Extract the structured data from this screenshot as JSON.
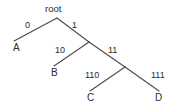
{
  "figure": {
    "type": "binary-tree-diagram",
    "background_color": "#ffffff",
    "line_color": "#4a4a4a",
    "text_color": "#2b2b2b",
    "width": 180,
    "height": 109
  },
  "root": {
    "label": "root",
    "x": 57,
    "y": 18
  },
  "edges": [
    {
      "id": "e-root-A",
      "label": "0",
      "from": [
        57,
        18
      ],
      "to": [
        14,
        41
      ],
      "label_x": 25,
      "label_y": 21
    },
    {
      "id": "e-root-n1",
      "label": "1",
      "from": [
        57,
        18
      ],
      "to": [
        89,
        42
      ],
      "label_x": 72,
      "label_y": 21
    },
    {
      "id": "e-n1-B",
      "label": "10",
      "from": [
        89,
        42
      ],
      "to": [
        54,
        66
      ],
      "label_x": 55,
      "label_y": 46
    },
    {
      "id": "e-n1-n2",
      "label": "11",
      "from": [
        89,
        42
      ],
      "to": [
        125,
        67
      ],
      "label_x": 108,
      "label_y": 46
    },
    {
      "id": "e-n2-C",
      "label": "110",
      "from": [
        125,
        67
      ],
      "to": [
        90,
        91
      ],
      "label_x": 85,
      "label_y": 71
    },
    {
      "id": "e-n2-D",
      "label": "111",
      "from": [
        125,
        67
      ],
      "to": [
        159,
        91
      ],
      "label_x": 151,
      "label_y": 71
    }
  ],
  "leaves": [
    {
      "id": "leaf-A",
      "label": "A",
      "code": "0",
      "x": 13,
      "y": 43
    },
    {
      "id": "leaf-B",
      "label": "B",
      "code": "10",
      "x": 51,
      "y": 68
    },
    {
      "id": "leaf-C",
      "label": "C",
      "code": "110",
      "x": 87,
      "y": 93
    },
    {
      "id": "leaf-D",
      "label": "D",
      "code": "111",
      "x": 155,
      "y": 93
    }
  ],
  "internal_nodes": [
    {
      "id": "node-root",
      "x": 57,
      "y": 18
    },
    {
      "id": "node-1",
      "x": 89,
      "y": 42
    },
    {
      "id": "node-11",
      "x": 125,
      "y": 67
    }
  ]
}
